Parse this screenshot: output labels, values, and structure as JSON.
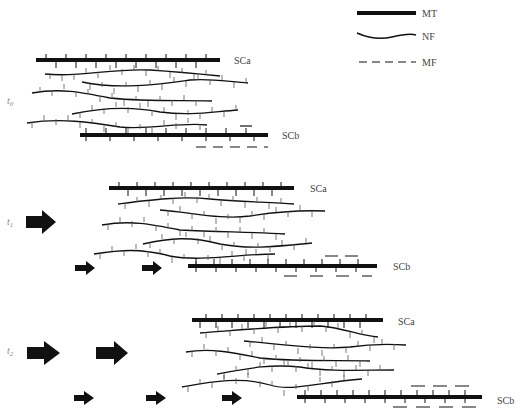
{
  "legend": {
    "items": [
      {
        "key": "MT",
        "label": "MT",
        "style": "thick-solid"
      },
      {
        "key": "NF",
        "label": "NF",
        "style": "wavy-thin"
      },
      {
        "key": "MF",
        "label": "MF",
        "style": "dashed"
      }
    ]
  },
  "panels": [
    {
      "time_label": "t0",
      "time_main": "t",
      "time_sub": "0",
      "sca_label": "SCa",
      "scb_label": "SCb"
    },
    {
      "time_label": "t1",
      "time_main": "t",
      "time_sub": "1",
      "sca_label": "SCa",
      "scb_label": "SCb"
    },
    {
      "time_label": "t2",
      "time_main": "t",
      "time_sub": "2",
      "sca_label": "SCa",
      "scb_label": "SCb"
    }
  ],
  "colors": {
    "ink": "#111111",
    "label": "#444444"
  }
}
